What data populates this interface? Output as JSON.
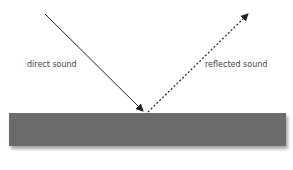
{
  "diagram": {
    "labels": {
      "direct": "direct sound",
      "reflected": "reflected sound"
    },
    "colors": {
      "surface": "#6b6b6b",
      "arrow": "#222222",
      "text": "#444444"
    }
  }
}
